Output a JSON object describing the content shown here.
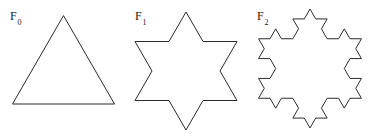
{
  "figure": {
    "background_color": "#ffffff",
    "stroke_color": "#2b2b2b",
    "stroke_width": 1,
    "caption_font_size": 12
  },
  "panels": [
    {
      "id": "f0",
      "label_base": "F",
      "label_sub": "0",
      "iteration": 0,
      "shape_name": "equilateral-triangle",
      "sides": 3,
      "description": "Koch snowflake initiator: equilateral triangle"
    },
    {
      "id": "f1",
      "label_base": "F",
      "label_sub": "1",
      "iteration": 1,
      "shape_name": "six-pointed-star",
      "sides": 12,
      "description": "Koch snowflake iteration 1: six-pointed star"
    },
    {
      "id": "f2",
      "label_base": "F",
      "label_sub": "2",
      "iteration": 2,
      "shape_name": "koch-snowflake-stage-2",
      "sides": 48,
      "description": "Koch snowflake iteration 2"
    }
  ],
  "chart_data": {
    "type": "diagram",
    "title": "",
    "subtitle": "",
    "xlabel": "",
    "ylabel": "",
    "grid": false,
    "legend": false,
    "series": [
      {
        "name": "F0",
        "label": "F₀",
        "iteration": 0,
        "segment_count": 3,
        "viewbox": [
          0,
          0,
          124,
          136
        ],
        "vertices": [
          [
            12.5,
            104.0
          ],
          [
            114.5,
            104.0
          ],
          [
            63.5,
            15.6
          ]
        ]
      },
      {
        "name": "F1",
        "label": "F₁",
        "iteration": 1,
        "segment_count": 12,
        "viewbox": [
          0,
          0,
          124,
          136
        ],
        "vertices": [
          [
            11.0,
            100.5
          ],
          [
            45.0,
            100.5
          ],
          [
            62.0,
            130.0
          ],
          [
            79.0,
            100.5
          ],
          [
            113.0,
            100.5
          ],
          [
            96.0,
            71.0
          ],
          [
            113.0,
            41.5
          ],
          [
            79.0,
            41.5
          ],
          [
            62.0,
            12.0
          ],
          [
            45.0,
            41.5
          ],
          [
            11.0,
            41.5
          ],
          [
            28.0,
            71.0
          ]
        ]
      },
      {
        "name": "F2",
        "label": "F₂",
        "iteration": 2,
        "segment_count": 48,
        "viewbox": [
          0,
          0,
          124,
          136
        ],
        "base_vertices": [
          [
            11.0,
            100.5
          ],
          [
            45.0,
            100.5
          ],
          [
            62.0,
            130.0
          ],
          [
            79.0,
            100.5
          ],
          [
            113.0,
            100.5
          ],
          [
            96.0,
            71.0
          ],
          [
            113.0,
            41.5
          ],
          [
            79.0,
            41.5
          ],
          [
            62.0,
            12.0
          ],
          [
            45.0,
            41.5
          ],
          [
            11.0,
            41.5
          ],
          [
            28.0,
            71.0
          ]
        ]
      }
    ]
  }
}
